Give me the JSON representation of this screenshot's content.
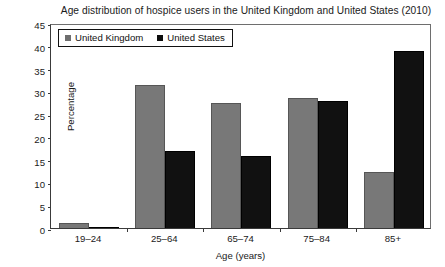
{
  "chart_data": {
    "type": "bar",
    "title": "Age distribution of hospice users in the United Kingdom and United States (2010)",
    "xlabel": "Age (years)",
    "ylabel": "Percentage",
    "categories": [
      "19–24",
      "25–64",
      "65–74",
      "75–84",
      "85+"
    ],
    "series": [
      {
        "name": "United Kingdom",
        "color": "#787878",
        "values": [
          1.0,
          31.5,
          27.5,
          28.5,
          12.2
        ]
      },
      {
        "name": "United States",
        "color": "#111111",
        "values": [
          0.3,
          16.8,
          15.7,
          27.8,
          38.8
        ]
      }
    ],
    "ylim": [
      0,
      45
    ],
    "yticks": [
      "0",
      "5",
      "10",
      "15",
      "20",
      "25",
      "30",
      "35",
      "40",
      "45"
    ],
    "grid": false,
    "legend_position": "top-left"
  },
  "legend": {
    "items": [
      {
        "label": "United Kingdom"
      },
      {
        "label": "United States"
      }
    ]
  }
}
